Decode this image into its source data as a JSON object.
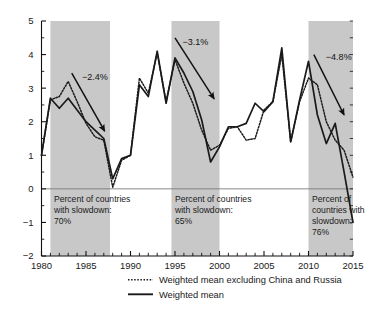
{
  "chart_data": {
    "type": "line",
    "title": "",
    "xlabel": "",
    "ylabel": "",
    "xlim": [
      1980,
      2015
    ],
    "ylim": [
      -2,
      5
    ],
    "grid": false,
    "zero_line": true,
    "x_ticks_labeled": [
      "1980",
      "1985",
      "1990",
      "1995",
      "2000",
      "2005",
      "2010",
      "2015"
    ],
    "x_tick_values": [
      1980,
      1985,
      1990,
      1995,
      2000,
      2005,
      2010,
      2015
    ],
    "x_minor_tick_step": 1,
    "y_ticks_labeled": [
      "5",
      "4",
      "3",
      "2",
      "1",
      "0",
      "-1",
      "-2"
    ],
    "y_tick_values": [
      5,
      4,
      3,
      2,
      1,
      0,
      -1,
      -2
    ],
    "y_minor_tick_step": 0.5,
    "legend_position": "bottom-center",
    "x": [
      1980,
      1981,
      1982,
      1983,
      1984,
      1985,
      1986,
      1987,
      1988,
      1989,
      1990,
      1991,
      1992,
      1993,
      1994,
      1995,
      1996,
      1997,
      1998,
      1999,
      2000,
      2001,
      2002,
      2003,
      2004,
      2005,
      2006,
      2007,
      2008,
      2009,
      2010,
      2011,
      2012,
      2013,
      2014,
      2015
    ],
    "series": [
      {
        "name": "Weighted mean",
        "style": "solid",
        "color": "#1a1a1a",
        "values": [
          1.0,
          2.7,
          2.4,
          2.7,
          2.35,
          2.0,
          1.75,
          1.5,
          0.3,
          0.9,
          1.0,
          3.1,
          2.75,
          4.1,
          2.55,
          3.9,
          3.45,
          2.9,
          2.05,
          0.8,
          1.25,
          1.85,
          1.85,
          1.95,
          2.55,
          2.3,
          2.6,
          4.2,
          1.4,
          2.65,
          3.8,
          2.2,
          1.35,
          1.95,
          0.5,
          -1.0
        ]
      },
      {
        "name": "Weighted mean excluding China and Russia",
        "style": "dotted",
        "color": "#1a1a1a",
        "values": [
          1.0,
          2.65,
          2.75,
          3.2,
          2.6,
          1.95,
          1.55,
          1.45,
          0.05,
          0.85,
          1.0,
          3.3,
          2.85,
          4.05,
          2.6,
          3.85,
          3.15,
          2.55,
          1.75,
          1.15,
          1.3,
          1.8,
          1.85,
          1.45,
          1.5,
          2.35,
          2.6,
          4.0,
          1.4,
          2.6,
          3.3,
          3.1,
          2.0,
          1.45,
          1.15,
          0.35
        ]
      }
    ],
    "shaded_bands": [
      {
        "x_start": 1981.0,
        "x_end": 1987.7
      },
      {
        "x_start": 1994.6,
        "x_end": 2000.0
      },
      {
        "x_start": 2010.0,
        "x_end": 2015.0
      }
    ],
    "band_color": "#c8c8c8",
    "arrow_annotations": [
      {
        "label": "−2.4%",
        "x_start": 1983.4,
        "y_start": 3.45,
        "x_end": 1987.1,
        "y_end": 1.72,
        "label_x": 1986.0,
        "label_y": 3.25
      },
      {
        "label": "−3.1%",
        "x_start": 1995.0,
        "y_start": 4.5,
        "x_end": 1999.4,
        "y_end": 2.68,
        "label_x": 1997.3,
        "label_y": 4.3
      },
      {
        "label": "−4.8%",
        "x_start": 2010.6,
        "y_start": 4.0,
        "x_end": 2014.0,
        "y_end": 2.2,
        "label_x": 2013.4,
        "label_y": 3.85
      }
    ],
    "text_annotations": [
      {
        "lines": [
          "Percent of countries",
          "with slowdown:",
          "70%"
        ],
        "x": 1981.4,
        "y": -0.38
      },
      {
        "lines": [
          "Percent of countries",
          "with slowdown:",
          "65%"
        ],
        "x": 1995.0,
        "y": -0.38
      },
      {
        "lines": [
          "Percent of",
          "countries with",
          "slowdown:",
          "76%"
        ],
        "x": 2010.4,
        "y": -0.38
      }
    ]
  },
  "legend": {
    "items": [
      {
        "label": "Weighted mean excluding China and Russia",
        "style": "dotted"
      },
      {
        "label": "Weighted mean",
        "style": "solid"
      }
    ]
  }
}
